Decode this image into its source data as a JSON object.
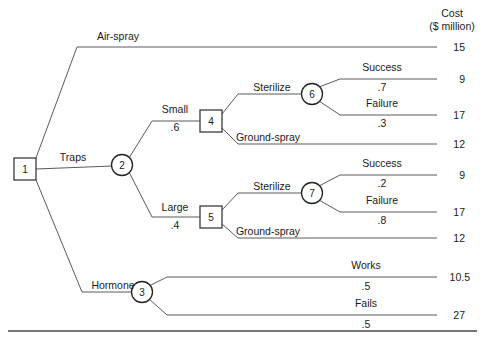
{
  "figure": {
    "type": "decision-tree",
    "payoff_header": {
      "line1": "Cost",
      "line2": "($ million)"
    }
  },
  "nodes": [
    {
      "id": "1",
      "label": "1",
      "kind": "decision",
      "shape": "square",
      "x": 25,
      "y": 169
    },
    {
      "id": "2",
      "label": "2",
      "kind": "chance",
      "shape": "circle",
      "x": 122,
      "y": 165
    },
    {
      "id": "3",
      "label": "3",
      "kind": "chance",
      "shape": "circle",
      "x": 142,
      "y": 292
    },
    {
      "id": "4",
      "label": "4",
      "kind": "decision",
      "shape": "square",
      "x": 211,
      "y": 121
    },
    {
      "id": "5",
      "label": "5",
      "kind": "decision",
      "shape": "square",
      "x": 211,
      "y": 217
    },
    {
      "id": "6",
      "label": "6",
      "kind": "chance",
      "shape": "circle",
      "x": 312,
      "y": 94
    },
    {
      "id": "7",
      "label": "7",
      "kind": "chance",
      "shape": "circle",
      "x": 312,
      "y": 193
    }
  ],
  "branches": [
    {
      "name": "air-spray",
      "label": "Air-spray",
      "probability": "",
      "from": "1",
      "to": "terminal-15"
    },
    {
      "name": "traps",
      "label": "Traps",
      "probability": "",
      "from": "1",
      "to": "2"
    },
    {
      "name": "hormone",
      "label": "Hormone",
      "probability": "",
      "from": "1",
      "to": "3"
    },
    {
      "name": "small",
      "label": "Small",
      "probability": ".6",
      "from": "2",
      "to": "4"
    },
    {
      "name": "large",
      "label": "Large",
      "probability": ".4",
      "from": "2",
      "to": "5"
    },
    {
      "name": "sterilize-small",
      "label": "Sterilize",
      "probability": "",
      "from": "4",
      "to": "6"
    },
    {
      "name": "ground-spray-small",
      "label": "Ground-spray",
      "probability": "",
      "from": "4",
      "to": "terminal-12a"
    },
    {
      "name": "sterilize-large",
      "label": "Sterilize",
      "probability": "",
      "from": "5",
      "to": "7"
    },
    {
      "name": "ground-spray-large",
      "label": "Ground-spray",
      "probability": "",
      "from": "5",
      "to": "terminal-12b"
    },
    {
      "name": "success-6",
      "label": "Success",
      "probability": ".7",
      "from": "6",
      "to": "terminal-9a"
    },
    {
      "name": "failure-6",
      "label": "Failure",
      "probability": ".3",
      "from": "6",
      "to": "terminal-17a"
    },
    {
      "name": "success-7",
      "label": "Success",
      "probability": ".2",
      "from": "7",
      "to": "terminal-9b"
    },
    {
      "name": "failure-7",
      "label": "Failure",
      "probability": ".8",
      "from": "7",
      "to": "terminal-17b"
    },
    {
      "name": "works",
      "label": "Works",
      "probability": ".5",
      "from": "3",
      "to": "terminal-10-5"
    },
    {
      "name": "fails",
      "label": "Fails",
      "probability": ".5",
      "from": "3",
      "to": "terminal-27"
    }
  ],
  "payoffs": [
    {
      "name": "terminal-15",
      "value": "15",
      "y": 47
    },
    {
      "name": "terminal-9a",
      "value": "9",
      "y": 79
    },
    {
      "name": "terminal-17a",
      "value": "17",
      "y": 115
    },
    {
      "name": "terminal-12a",
      "value": "12",
      "y": 144
    },
    {
      "name": "terminal-9b",
      "value": "9",
      "y": 175
    },
    {
      "name": "terminal-17b",
      "value": "17",
      "y": 212
    },
    {
      "name": "terminal-12b",
      "value": "12",
      "y": 238
    },
    {
      "name": "terminal-10-5",
      "value": "10.5",
      "y": 277
    },
    {
      "name": "terminal-27",
      "value": "27",
      "y": 315
    }
  ],
  "labels": {
    "air_spray": {
      "text": "Air-spray",
      "x": 118,
      "y": 40
    },
    "traps": {
      "text": "Traps",
      "x": 73,
      "y": 161
    },
    "hormone": {
      "text": "Hormone",
      "x": 113,
      "y": 289
    },
    "small": {
      "text": "Small",
      "x": 175,
      "y": 113
    },
    "small_prob": {
      "text": ".6",
      "x": 175,
      "y": 127
    },
    "large": {
      "text": "Large",
      "x": 175,
      "y": 211
    },
    "large_prob": {
      "text": ".4",
      "x": 175,
      "y": 225
    },
    "sterilize_small": {
      "text": "Sterilize",
      "x": 272,
      "y": 90
    },
    "ground_spray_small": {
      "text": "Ground-spray",
      "x": 268,
      "y": 140
    },
    "sterilize_large": {
      "text": "Sterilize",
      "x": 272,
      "y": 189
    },
    "ground_spray_large": {
      "text": "Ground-spray",
      "x": 268,
      "y": 234
    },
    "success_6": {
      "text": "Success",
      "x": 382,
      "y": 68
    },
    "success_6_prob": {
      "text": ".7",
      "x": 382,
      "y": 88
    },
    "failure_6": {
      "text": "Failure",
      "x": 382,
      "y": 104
    },
    "failure_6_prob": {
      "text": ".3",
      "x": 382,
      "y": 124
    },
    "success_7": {
      "text": "Success",
      "x": 382,
      "y": 164
    },
    "success_7_prob": {
      "text": ".2",
      "x": 382,
      "y": 184
    },
    "failure_7": {
      "text": "Failure",
      "x": 382,
      "y": 201
    },
    "failure_7_prob": {
      "text": ".8",
      "x": 382,
      "y": 221
    },
    "works": {
      "text": "Works",
      "x": 366,
      "y": 266
    },
    "works_prob": {
      "text": ".5",
      "x": 366,
      "y": 287
    },
    "fails": {
      "text": "Fails",
      "x": 366,
      "y": 304
    },
    "fails_prob": {
      "text": ".5",
      "x": 366,
      "y": 325
    }
  }
}
